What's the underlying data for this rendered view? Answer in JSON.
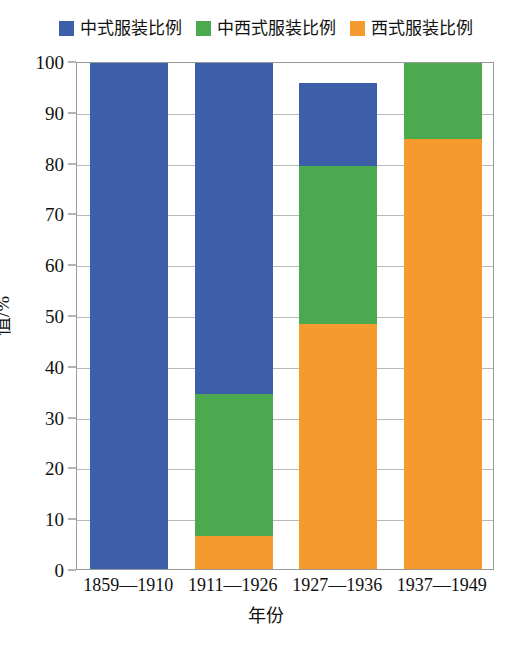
{
  "chart_data": {
    "type": "bar",
    "subtype": "stacked-bar",
    "title": "",
    "subtitle": "",
    "xlabel": "年份",
    "ylabel": "值/%",
    "ylim": [
      0,
      100
    ],
    "yticks": [
      0,
      10,
      20,
      30,
      40,
      50,
      60,
      70,
      80,
      90,
      100
    ],
    "ytick_labels": [
      "0",
      "10",
      "20",
      "30",
      "40",
      "50",
      "60",
      "70",
      "80",
      "90",
      "100"
    ],
    "grid": true,
    "grid_axis": "y",
    "legend_position": "top-center",
    "categories": [
      "1859—1910",
      "1911—1926",
      "1927—1936",
      "1937—1949"
    ],
    "series": [
      {
        "name": "中式服装比例",
        "color": "#3D5FA9",
        "values": [
          100.0,
          65.6,
          16.3,
          0.0
        ]
      },
      {
        "name": "中西式服装比例",
        "color": "#4BA94F",
        "values": [
          0.0,
          27.9,
          31.1,
          15.4
        ]
      },
      {
        "name": "西式服装比例",
        "color": "#F59B2E",
        "values": [
          0.0,
          6.5,
          48.2,
          84.6
        ]
      }
    ],
    "cumulative_tops": [
      [
        100.0,
        100.0,
        100.0,
        100.0
      ],
      [
        0.0,
        34.4,
        79.3,
        100.0
      ],
      [
        0.0,
        6.5,
        48.2,
        84.6
      ]
    ],
    "bar_totals": [
      100.0,
      100.0,
      95.5,
      100.0
    ],
    "annotations": []
  },
  "legend": {
    "entries": [
      {
        "label": "中式服装比例",
        "color": "#3D5FA9",
        "swatch": "square-swatch"
      },
      {
        "label": "中西式服装比例",
        "color": "#4BA94F",
        "swatch": "square-swatch"
      },
      {
        "label": "西式服装比例",
        "color": "#F59B2E",
        "swatch": "square-swatch"
      }
    ]
  },
  "axes": {
    "y_title": "值/%",
    "x_title": "年份"
  },
  "colors": {
    "blue": "#3D5FA9",
    "green": "#4BA94F",
    "orange": "#F59B2E",
    "frame": "#9a9a9a",
    "grid": "#b9b9b9",
    "background": "#ffffff",
    "text": "#111111"
  }
}
